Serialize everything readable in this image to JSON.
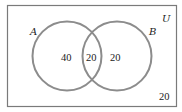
{
  "diagram": {
    "type": "venn",
    "universe": {
      "label": "U",
      "outside_count": "20"
    },
    "sets": [
      {
        "label": "A",
        "only_count": "40"
      },
      {
        "label": "B",
        "only_count": "20"
      }
    ],
    "intersection": {
      "label": "A∩B",
      "count": "20"
    },
    "colors": {
      "circle_stroke": "#8c8c8c",
      "rect_stroke": "#7a7a7a",
      "text": "#222222",
      "background": "#ffffff"
    }
  }
}
